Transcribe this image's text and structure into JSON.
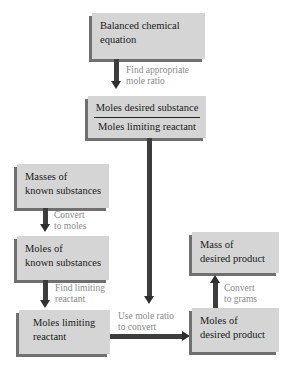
{
  "diagram": {
    "nodes": {
      "balanced": {
        "line1": "Balanced chemical",
        "line2": "equation"
      },
      "ratio": {
        "numerator": "Moles desired substance",
        "denominator": "Moles limiting reactant"
      },
      "masses_known": {
        "line1": "Masses of",
        "line2": "known substances"
      },
      "moles_known": {
        "line1": "Moles of",
        "line2": "known substances"
      },
      "moles_limiting": {
        "line1": "Moles limiting",
        "line2": "reactant"
      },
      "moles_product": {
        "line1": "Moles of",
        "line2": "desired product"
      },
      "mass_product": {
        "line1": "Mass of",
        "line2": "desired product"
      }
    },
    "edges": {
      "find_ratio": {
        "line1": "Find appropriate",
        "line2": "mole ratio"
      },
      "convert_moles": {
        "line1": "Convert",
        "line2": "to moles"
      },
      "find_limiting": {
        "line1": "Find limiting",
        "line2": "reactant"
      },
      "use_ratio": {
        "line1": "Use mole ratio",
        "line2": "to convert"
      },
      "convert_grams": {
        "line1": "Convert",
        "line2": "to grams"
      }
    },
    "colors": {
      "box_fill": "#d5d5d5",
      "box_shadow": "#707070",
      "arrow": "#3d3d3d",
      "label_text": "#8a8a8a"
    }
  }
}
